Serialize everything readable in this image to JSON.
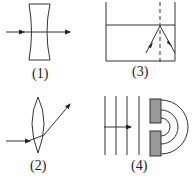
{
  "figure": {
    "panels": [
      {
        "id": "1",
        "label": "(1)",
        "description": "concave lens with ray passing straight through"
      },
      {
        "id": "2",
        "label": "(2)",
        "description": "convex lens refracting ray"
      },
      {
        "id": "3",
        "label": "(3)",
        "description": "reflection at water surface with normal line"
      },
      {
        "id": "4",
        "label": "(4)",
        "description": "plane waves diffracting through slit"
      }
    ],
    "colors": {
      "line": "#333333",
      "block": "#999999"
    }
  }
}
